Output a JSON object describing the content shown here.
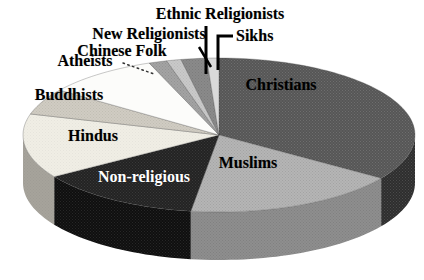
{
  "figure": {
    "background": "#ffffff",
    "width_px": 424,
    "height_px": 280
  },
  "chart_data": {
    "type": "pie",
    "projection": "3d",
    "title": "",
    "legend_position": "none",
    "start_angle_deg": 90,
    "direction": "clockwise",
    "unit": "percent of world population (estimated from slice angles)",
    "categories": [
      "Christians",
      "Muslims",
      "Non-religious",
      "Hindus",
      "Buddhists",
      "Atheists",
      "Chinese Folk",
      "New Religionists",
      "Ethnic Religionists",
      "Sikhs"
    ],
    "values": [
      34.5,
      17.8,
      13.6,
      13.5,
      5.5,
      9.3,
      1.5,
      1.2,
      2.1,
      1.0
    ],
    "geometry": {
      "cx": 219,
      "cy": 135,
      "rx": 196,
      "ry": 77,
      "depth": 48
    },
    "slices": [
      {
        "label": "Christians",
        "value": 34.5,
        "top_color": "#565656",
        "side_color": "#2e2e2e",
        "texture": "light",
        "texture_opacity": 0.14,
        "label_pos": [
          281,
          85
        ],
        "label_anchor": "center",
        "label_color": "#000000"
      },
      {
        "label": "Muslims",
        "value": 17.8,
        "top_color": "#b5b5b5",
        "side_color": "#8e8e8e",
        "texture": "dark",
        "texture_opacity": 0.1,
        "label_pos": [
          248,
          163
        ],
        "label_anchor": "center",
        "label_color": "#000000"
      },
      {
        "label": "Non-religious",
        "value": 13.6,
        "top_color": "#232323",
        "side_color": "#0f0f0f",
        "texture": "light",
        "texture_opacity": 0.1,
        "label_pos": [
          144,
          177
        ],
        "label_anchor": "center",
        "label_color": "#ffffff"
      },
      {
        "label": "Hindus",
        "value": 13.5,
        "top_color": "#f0eee5",
        "side_color": "#a6a39b",
        "texture": "dark",
        "texture_opacity": 0.04,
        "label_pos": [
          93,
          136
        ],
        "label_anchor": "center",
        "label_color": "#000000"
      },
      {
        "label": "Buddhists",
        "value": 5.5,
        "top_color": "#d0ccc2",
        "side_color": "#9a978f",
        "texture": "dark",
        "texture_opacity": 0.07,
        "label_pos": [
          69,
          95
        ],
        "label_anchor": "center",
        "label_color": "#000000"
      },
      {
        "label": "Atheists",
        "value": 9.3,
        "top_color": "#fcfcfa",
        "side_color": "#c9c9c9",
        "texture": "none",
        "texture_opacity": 0,
        "label_pos": [
          85,
          61
        ],
        "label_anchor": "center",
        "label_color": "#000000"
      },
      {
        "label": "Chinese Folk",
        "value": 1.5,
        "top_color": "#a3a3a3",
        "side_color": "#7a7a7a",
        "texture": "dark",
        "texture_opacity": 0.1,
        "label_pos": [
          122,
          51
        ],
        "label_anchor": "center",
        "label_color": "#000000"
      },
      {
        "label": "New Religionists",
        "value": 1.2,
        "top_color": "#c9c9c9",
        "side_color": "#9a9a9a",
        "texture": "dark",
        "texture_opacity": 0.07,
        "label_pos": [
          149,
          34
        ],
        "label_anchor": "center",
        "label_color": "#000000"
      },
      {
        "label": "Ethnic Religionists",
        "value": 2.1,
        "top_color": "#8a8a8a",
        "side_color": "#666666",
        "texture": "dark",
        "texture_opacity": 0.1,
        "label_pos": [
          220,
          14
        ],
        "label_anchor": "center",
        "label_color": "#000000"
      },
      {
        "label": "Sikhs",
        "value": 1.0,
        "top_color": "#d9d9d9",
        "side_color": "#ababab",
        "texture": "none",
        "texture_opacity": 0,
        "label_pos": [
          236,
          36
        ],
        "label_anchor": "left",
        "label_color": "#000000"
      }
    ],
    "leader_lines": [
      {
        "name": "atheists-leader-line",
        "style": "dotted",
        "width": 1.5,
        "color": "#333333",
        "points": [
          [
            123,
            63
          ],
          [
            154,
            74
          ]
        ]
      },
      {
        "name": "new-religionists-leader-line",
        "style": "solid",
        "width": 2.5,
        "color": "#000000",
        "points": [
          [
            199,
            47
          ],
          [
            211,
            67
          ]
        ]
      },
      {
        "name": "ethnic-religionists-leader-line",
        "style": "solid",
        "width": 3,
        "color": "#000000",
        "points": [
          [
            206,
            26
          ],
          [
            206,
            74
          ]
        ]
      },
      {
        "name": "sikhs-leader-line",
        "style": "solid",
        "width": 3,
        "color": "#000000",
        "points": [
          [
            233,
            36
          ],
          [
            218,
            36
          ],
          [
            218,
            70
          ]
        ]
      }
    ]
  }
}
